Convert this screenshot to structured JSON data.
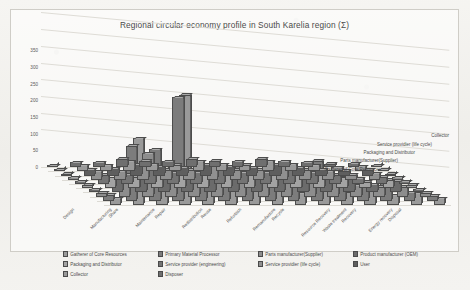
{
  "chart": {
    "title": "Regional circular economy profile in South Karelia region (Σ)"
  },
  "chart_data": {
    "type": "bar",
    "subtype": "3d-clustered-column",
    "title": "Regional circular economy profile in South Karelia region (Σ)",
    "xlabel": "",
    "ylabel": "",
    "ylim": [
      0,
      350
    ],
    "yticks": [
      0,
      50,
      100,
      150,
      200,
      250,
      300,
      350
    ],
    "grid": true,
    "legend_position": "bottom",
    "categories": [
      "Design",
      "Manufacturing",
      "Share",
      "Maintenance",
      "Repair",
      "Redistribution",
      "Reuse",
      "Refurbish",
      "Remanufacture",
      "Recycle",
      "Resource Recovery",
      "Waste treatment",
      "Recovery",
      "Energy recovery",
      "Disposal"
    ],
    "depth_axis_labels": [
      "Collector",
      "Service providier (life cycle)",
      "Packaging and Distributor",
      "Parts manufacturer(Supplier)",
      "Gatherer of Core Resources"
    ],
    "series": [
      {
        "name": "Gatherer of Core Resources",
        "color": "#9a9a9a",
        "values": [
          20,
          200,
          60,
          330,
          50,
          95,
          45,
          90,
          35,
          95,
          40,
          55,
          30,
          35,
          20
        ]
      },
      {
        "name": "Primary Material Processor",
        "color": "#7c7c7c",
        "values": [
          18,
          165,
          155,
          310,
          70,
          60,
          80,
          60,
          95,
          120,
          75,
          40,
          60,
          25,
          15
        ]
      },
      {
        "name": "Parts manufacturer(Supplier)",
        "color": "#8d8d8d",
        "values": [
          12,
          45,
          130,
          85,
          40,
          50,
          95,
          45,
          60,
          55,
          55,
          35,
          30,
          30,
          12
        ]
      },
      {
        "name": "Product manufacturer (OEM)",
        "color": "#6b6b6b",
        "values": [
          10,
          40,
          45,
          60,
          55,
          45,
          60,
          50,
          45,
          65,
          45,
          45,
          25,
          35,
          10
        ]
      },
      {
        "name": "Packaging and Distributor",
        "color": "#a3a3a3",
        "values": [
          10,
          30,
          35,
          50,
          45,
          40,
          55,
          40,
          40,
          50,
          40,
          30,
          20,
          25,
          10
        ]
      },
      {
        "name": "Service provider (engineering)",
        "color": "#747474",
        "values": [
          8,
          28,
          30,
          45,
          35,
          35,
          45,
          35,
          35,
          45,
          35,
          28,
          18,
          22,
          8
        ]
      },
      {
        "name": "Service providier (life cycle)",
        "color": "#909090",
        "values": [
          8,
          25,
          25,
          40,
          30,
          30,
          40,
          30,
          30,
          40,
          30,
          25,
          15,
          20,
          8
        ]
      },
      {
        "name": "User",
        "color": "#5e5e5e",
        "values": [
          6,
          20,
          22,
          35,
          28,
          25,
          35,
          28,
          25,
          35,
          25,
          20,
          15,
          18,
          6
        ]
      },
      {
        "name": "Collector",
        "color": "#999999",
        "values": [
          5,
          18,
          18,
          30,
          22,
          20,
          30,
          22,
          20,
          30,
          22,
          18,
          12,
          15,
          5
        ]
      },
      {
        "name": "Disposer",
        "color": "#6f6f6f",
        "values": [
          5,
          15,
          15,
          25,
          20,
          18,
          25,
          20,
          18,
          25,
          18,
          15,
          10,
          12,
          5
        ]
      }
    ]
  },
  "legend": {
    "items": [
      {
        "label": "Gatherer of Core Resources",
        "color": "#9a9a9a"
      },
      {
        "label": "Primary Material Processor",
        "color": "#7c7c7c"
      },
      {
        "label": "Parts manufacturer(Supplier)",
        "color": "#8d8d8d"
      },
      {
        "label": "Product manufacturer (OEM)",
        "color": "#6b6b6b"
      },
      {
        "label": "Packaging and Distributor",
        "color": "#a3a3a3"
      },
      {
        "label": "Service provider (engineering)",
        "color": "#747474"
      },
      {
        "label": "Service providier (life cycle)",
        "color": "#909090"
      },
      {
        "label": "User",
        "color": "#5e5e5e"
      },
      {
        "label": "Collector",
        "color": "#999999"
      },
      {
        "label": "Disposer",
        "color": "#6f6f6f"
      }
    ]
  }
}
